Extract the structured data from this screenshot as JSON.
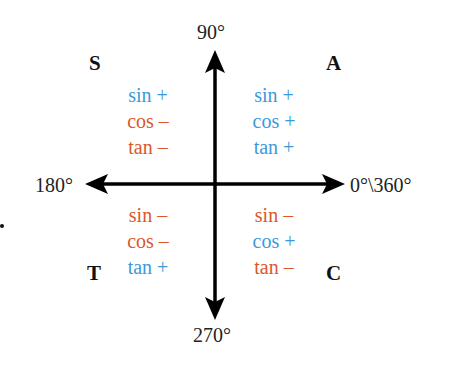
{
  "diagram": {
    "colors": {
      "positive": "#3a9ad9",
      "negative": "#d9582b",
      "axis": "#000000",
      "text": "#222222"
    },
    "axes": {
      "top": "90°",
      "left": "180°",
      "right": "0°\\360°",
      "bottom": "270°"
    },
    "quadrants": {
      "q2": {
        "letter": "S",
        "items": [
          {
            "label": "sin +",
            "sign": "positive"
          },
          {
            "label": "cos –",
            "sign": "negative"
          },
          {
            "label": "tan –",
            "sign": "negative"
          }
        ]
      },
      "q1": {
        "letter": "A",
        "items": [
          {
            "label": "sin +",
            "sign": "positive"
          },
          {
            "label": "cos +",
            "sign": "positive"
          },
          {
            "label": "tan +",
            "sign": "positive"
          }
        ]
      },
      "q3": {
        "letter": "T",
        "items": [
          {
            "label": "sin –",
            "sign": "negative"
          },
          {
            "label": "cos –",
            "sign": "negative"
          },
          {
            "label": "tan +",
            "sign": "positive"
          }
        ]
      },
      "q4": {
        "letter": "C",
        "items": [
          {
            "label": "sin –",
            "sign": "negative"
          },
          {
            "label": "cos +",
            "sign": "positive"
          },
          {
            "label": "tan –",
            "sign": "negative"
          }
        ]
      }
    }
  }
}
